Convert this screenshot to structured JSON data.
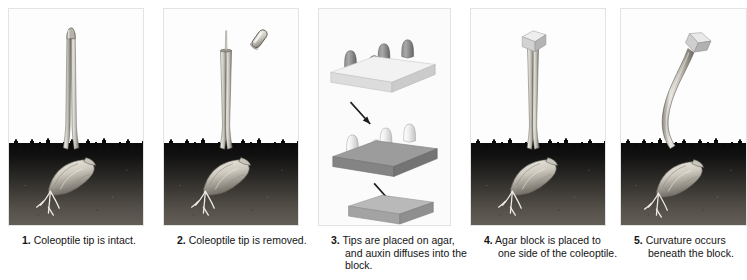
{
  "figure": {
    "panel_count": 5,
    "soil_color": "#101010",
    "agar_light_color": "#efefef",
    "agar_dark_color": "#8f8f8f",
    "coleoptile_color": "#b9b6ae"
  },
  "panels": [
    {
      "id": "panel-1",
      "number": "1.",
      "caption": "Coleoptile tip is intact.",
      "caption_lines": [
        "Coleoptile tip is",
        "intact."
      ],
      "scene": "intact-coleoptile",
      "x": 8,
      "width": 136
    },
    {
      "id": "panel-2",
      "number": "2.",
      "caption": "Coleoptile tip is removed.",
      "caption_lines": [
        "Coleoptile tip is",
        "removed."
      ],
      "scene": "tip-removed-coleoptile",
      "x": 163,
      "width": 136
    },
    {
      "id": "panel-3",
      "number": "3.",
      "caption": "Tips are placed on agar, and auxin diffuses into the block.",
      "caption_lines": [
        "Tips are placed on",
        "agar, and auxin",
        "diffuses into the block."
      ],
      "scene": "tips-on-agar-blocks",
      "x": 318,
      "width": 133
    },
    {
      "id": "panel-4",
      "number": "4.",
      "caption": "Agar block is placed to one side of the coleoptile.",
      "caption_lines": [
        "Agar block is placed",
        "to one side of the",
        "coleoptile."
      ],
      "scene": "block-on-coleoptile",
      "x": 470,
      "width": 136
    },
    {
      "id": "panel-5",
      "number": "5.",
      "caption": "Curvature occurs beneath the block.",
      "caption_lines": [
        "Curvature occurs",
        "beneath the block."
      ],
      "scene": "curved-coleoptile",
      "x": 620,
      "width": 127
    }
  ],
  "panel3_stages": [
    {
      "label": "tips-on-fresh-agar",
      "block_shade": "light",
      "tip_shade": "dark",
      "tip_count": 4
    },
    {
      "label": "tips-on-auxin-agar",
      "block_shade": "dark",
      "tip_shade": "light",
      "tip_count": 4
    },
    {
      "label": "auxin-loaded-block",
      "block_shade": "medium",
      "tip_shade": "none",
      "tip_count": 0
    }
  ],
  "arrows": [
    {
      "name": "arrow-stage1-to-stage2",
      "direction": "down-right"
    },
    {
      "name": "arrow-stage2-to-stage3",
      "direction": "down-right"
    }
  ]
}
